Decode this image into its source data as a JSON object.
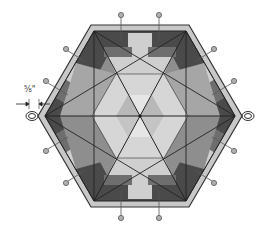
{
  "figure": {
    "type": "hexagon quilt block diagram",
    "dimension_label": "5/8\"",
    "dimension_display": "⅝\""
  },
  "colors": {
    "border_light": "#c8c8c8",
    "border_edge": "#3a3a3a",
    "dark": "#4a4a4a",
    "medium_dark": "#6e6e6e",
    "medium": "#8e8e8e",
    "light": "#b4b4b4",
    "lighter": "#cfcfcf",
    "lightest": "#e2e2e2",
    "pin": "#a0a0a0",
    "line": "#222222"
  },
  "pins": {
    "count": 12,
    "loops": 2
  }
}
